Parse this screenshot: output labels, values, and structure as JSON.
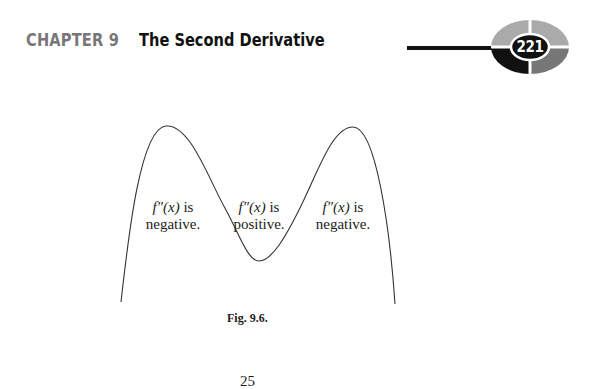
{
  "header": {
    "chapter_label": "CHAPTER 9",
    "chapter_title": "The Second Derivative",
    "page_number": "221",
    "colors": {
      "chapter_label": "#777777",
      "title": "#111111",
      "rule": "#111111",
      "badge_top": "#aaaaaa",
      "badge_bottom_left": "#111111",
      "badge_bottom_right": "#777777"
    }
  },
  "figure": {
    "regions": [
      {
        "line1_math": "f″(x)",
        "line1_text": " is",
        "line2": "negative."
      },
      {
        "line1_math": "f″(x)",
        "line1_text": " is",
        "line2": "positive."
      },
      {
        "line1_math": "f″(x)",
        "line1_text": " is",
        "line2": "negative."
      }
    ],
    "caption": "Fig. 9.6.",
    "curve": {
      "description": "M-shaped curve: rises to a maximum, dips to a minimum, rises to a second maximum, then falls",
      "key_points_px": {
        "left_end": [
          121,
          302
        ],
        "left_peak": [
          166,
          126
        ],
        "trough": [
          259,
          261
        ],
        "right_peak": [
          353,
          127
        ],
        "right_end": [
          395,
          304
        ]
      }
    }
  },
  "footer": {
    "partial_text": "25"
  }
}
